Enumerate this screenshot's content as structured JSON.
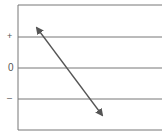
{
  "diagram": {
    "type": "correlation-axis-sketch",
    "axis_labels": {
      "positive": "+",
      "zero": "0",
      "negative": "–"
    },
    "gridlines_y": [
      5,
      37,
      68,
      99,
      130
    ],
    "arrow": {
      "style": "double-headed",
      "from": [
        37,
        28
      ],
      "to": [
        102,
        115
      ]
    },
    "colors": {
      "grid": "#666666",
      "arrow": "#555555",
      "text": "#555555"
    }
  }
}
